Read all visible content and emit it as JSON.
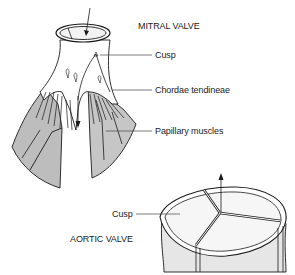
{
  "diagram": {
    "mitral": {
      "title": "MITRAL VALVE",
      "labels": {
        "cusp": "Cusp",
        "chordae": "Chordae tendineae",
        "papillary": "Papillary muscles"
      }
    },
    "aortic": {
      "title": "AORTIC VALVE",
      "labels": {
        "cusp": "Cusp"
      }
    },
    "colors": {
      "line": "#1a1a1a",
      "muscle_fill": "#bdbdbd",
      "leader": "#444444",
      "wall_fill": "#e6e6e6"
    }
  }
}
